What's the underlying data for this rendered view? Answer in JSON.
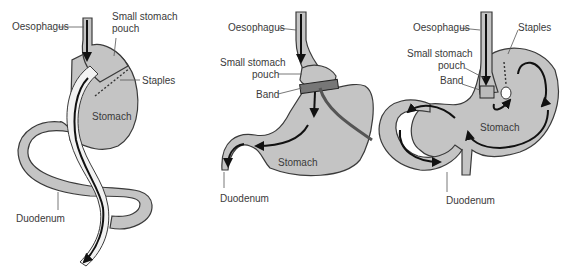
{
  "diagrams": [
    {
      "id": "gastric-bypass",
      "labels": {
        "oesophagus": "Oesophagus",
        "pouch_line1": "Small stomach",
        "pouch_line2": "pouch",
        "staples": "Staples",
        "stomach": "Stomach",
        "duodenum": "Duodenum"
      }
    },
    {
      "id": "gastric-band",
      "labels": {
        "oesophagus": "Oesophagus",
        "pouch_line1": "Small stomach",
        "pouch_line2": "pouch",
        "band": "Band",
        "stomach": "Stomach",
        "duodenum": "Duodenum"
      }
    },
    {
      "id": "vertical-banded-gastroplasty",
      "labels": {
        "oesophagus": "Oesophagus",
        "staples": "Staples",
        "pouch_line1": "Small stomach",
        "pouch_line2": "pouch",
        "band": "Band",
        "stomach": "Stomach",
        "duodenum": "Duodenum"
      }
    }
  ],
  "colors": {
    "organ_fill": "#c4c4c4",
    "outline": "#3a3a3a",
    "arrow": "#111111"
  }
}
